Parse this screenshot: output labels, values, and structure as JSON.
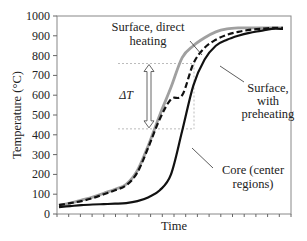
{
  "chart_data": {
    "type": "line",
    "title": "",
    "xlabel": "Time",
    "ylabel": "Temperature (°C)",
    "ylim": [
      0,
      1000
    ],
    "yticks": [
      0,
      100,
      200,
      300,
      400,
      500,
      600,
      700,
      800,
      900,
      1000
    ],
    "x_tick_count": 20,
    "grid": false,
    "x": [
      0,
      1,
      2,
      3,
      4,
      5,
      6,
      7,
      8,
      9,
      10,
      11,
      12,
      13,
      14,
      15,
      16,
      17,
      18,
      19,
      20
    ],
    "series": [
      {
        "name": "Surface, direct heating",
        "style": "solid",
        "color": "#a0a0a0",
        "values": [
          45,
          55,
          70,
          85,
          105,
          125,
          150,
          220,
          350,
          500,
          640,
          790,
          850,
          890,
          920,
          935,
          940,
          940,
          940,
          940,
          940
        ]
      },
      {
        "name": "Surface, with preheating",
        "style": "dashed",
        "color": "#111111",
        "values": [
          45,
          55,
          65,
          80,
          100,
          120,
          145,
          210,
          340,
          480,
          580,
          600,
          760,
          840,
          880,
          905,
          920,
          930,
          935,
          940,
          940
        ]
      },
      {
        "name": "Core (center regions)",
        "style": "solid",
        "color": "#111111",
        "values": [
          35,
          40,
          45,
          48,
          50,
          52,
          55,
          65,
          85,
          120,
          200,
          420,
          650,
          780,
          850,
          880,
          900,
          915,
          925,
          935,
          935
        ]
      }
    ],
    "annotations": [
      {
        "text": "Surface, direct heating",
        "target": "Surface, direct heating"
      },
      {
        "text": "Surface, with preheating",
        "target": "Surface, with preheating"
      },
      {
        "text": "Core (center regions)",
        "target": "Core (center regions)"
      },
      {
        "text": "ΔT",
        "type": "double-arrow",
        "from": 430,
        "to": 760
      }
    ],
    "legend": "none (inline callout labels)"
  },
  "labels": {
    "direct_1": "Surface, direct",
    "direct_2": "heating",
    "pre_1": "Surface,",
    "pre_2": "with",
    "pre_3": "preheating",
    "core_1": "Core (center",
    "core_2": "regions)",
    "delta": "ΔT",
    "xlabel": "Time",
    "ylabel": "Temperature (°C)"
  }
}
